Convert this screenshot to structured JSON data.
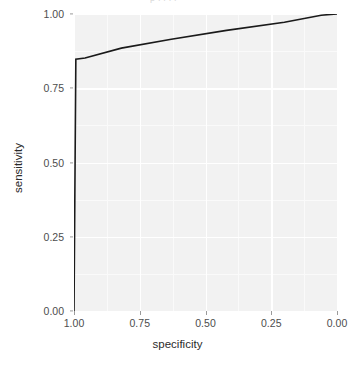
{
  "chart_data": {
    "type": "line",
    "title": "",
    "clipped_top_text": "p    .      .    .          .",
    "xlabel": "specificity",
    "ylabel": "sensitivity",
    "xlim": [
      1.0,
      0.0
    ],
    "ylim": [
      0.0,
      1.0
    ],
    "x_reversed": true,
    "grid": true,
    "legend": "none",
    "line_color": "#1a1a1a",
    "panel_background": "#f2f2f2",
    "gridline_color": "#ffffff",
    "xticks": [
      "1.00",
      "0.75",
      "0.50",
      "0.25",
      "0.00"
    ],
    "xtick_values": [
      1.0,
      0.75,
      0.5,
      0.25,
      0.0
    ],
    "yticks": [
      "0.00",
      "0.25",
      "0.50",
      "0.75",
      "1.00"
    ],
    "ytick_values": [
      0.0,
      0.25,
      0.5,
      0.75,
      1.0
    ],
    "series": [
      {
        "name": "roc",
        "x": [
          1.0,
          0.993,
          0.958,
          0.82,
          0.63,
          0.42,
          0.2,
          0.06,
          0.0
        ],
        "y": [
          0.0,
          0.848,
          0.852,
          0.885,
          0.915,
          0.945,
          0.972,
          0.996,
          1.0
        ]
      }
    ]
  },
  "axes": {
    "y_title": "sensitivity",
    "x_title": "specificity"
  }
}
